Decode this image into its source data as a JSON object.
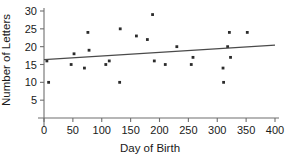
{
  "chart_data": {
    "type": "scatter",
    "title": "",
    "xlabel": "Day of Birth",
    "ylabel": "Number of Letters",
    "xlim": [
      0,
      400
    ],
    "ylim": [
      0,
      30
    ],
    "xticks": [
      0,
      50,
      100,
      150,
      200,
      250,
      300,
      350,
      400
    ],
    "yticks": [
      5,
      10,
      15,
      20,
      25,
      30
    ],
    "xtick_labels": [
      "0",
      "50",
      "100",
      "150",
      "200",
      "250",
      "300",
      "350",
      "400"
    ],
    "ytick_labels": [
      "5",
      "10",
      "15",
      "20",
      "25",
      "30"
    ],
    "grid": false,
    "legend": null,
    "point_color": "#2b2b2b",
    "line_color": "#4a4a4a",
    "axis_color": "#6f6f6f",
    "points": [
      {
        "x": 5,
        "y": 16
      },
      {
        "x": 8,
        "y": 10
      },
      {
        "x": 47,
        "y": 15
      },
      {
        "x": 52,
        "y": 18
      },
      {
        "x": 70,
        "y": 14
      },
      {
        "x": 76,
        "y": 24
      },
      {
        "x": 78,
        "y": 19
      },
      {
        "x": 107,
        "y": 15
      },
      {
        "x": 113,
        "y": 16
      },
      {
        "x": 131,
        "y": 10
      },
      {
        "x": 132,
        "y": 25
      },
      {
        "x": 160,
        "y": 23
      },
      {
        "x": 179,
        "y": 22
      },
      {
        "x": 188,
        "y": 29
      },
      {
        "x": 191,
        "y": 16
      },
      {
        "x": 210,
        "y": 15
      },
      {
        "x": 230,
        "y": 20
      },
      {
        "x": 255,
        "y": 15
      },
      {
        "x": 258,
        "y": 17
      },
      {
        "x": 310,
        "y": 14
      },
      {
        "x": 311,
        "y": 10
      },
      {
        "x": 318,
        "y": 20
      },
      {
        "x": 321,
        "y": 24
      },
      {
        "x": 323,
        "y": 17
      },
      {
        "x": 352,
        "y": 24
      }
    ],
    "trendline": {
      "x_start": 0,
      "y_start": 16.4,
      "x_end": 400,
      "y_end": 20.4
    }
  }
}
